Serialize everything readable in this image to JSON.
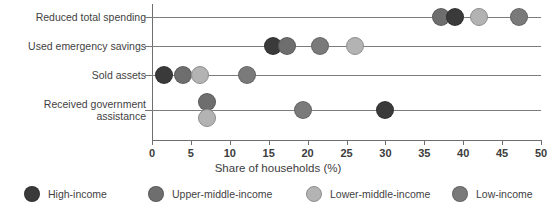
{
  "chart_data": {
    "type": "scatter",
    "title": "",
    "xlabel": "Share of households (%)",
    "ylabel": "",
    "xlim": [
      0,
      50
    ],
    "xticks": [
      0,
      5,
      10,
      15,
      20,
      25,
      30,
      35,
      40,
      45,
      50
    ],
    "xticklabels": [
      "0",
      "5",
      "10",
      "15",
      "20",
      "25",
      "30",
      "35",
      "40",
      "45",
      "50"
    ],
    "grid": false,
    "legend_position": "bottom",
    "categories": [
      "Reduced total spending",
      "Used emergency savings",
      "Sold assets",
      "Received government assistance"
    ],
    "series": [
      {
        "name": "High-income",
        "color": "#3a3a3a",
        "values": [
          38.9,
          15.6,
          1.5,
          30.0
        ]
      },
      {
        "name": "Upper-middle-income",
        "color": "#6e6e6e",
        "values": [
          37.1,
          17.4,
          4.0,
          7.1
        ]
      },
      {
        "name": "Lower-middle-income",
        "color": "#b3b3b3",
        "values": [
          42.0,
          26.1,
          6.2,
          7.1
        ]
      },
      {
        "name": "Low-income",
        "color": "#7a7a7a",
        "values": [
          47.2,
          21.6,
          12.2,
          19.4
        ]
      }
    ]
  },
  "axis": {
    "x_title": "Share of households (%)",
    "tick_labels": [
      "0",
      "5",
      "10",
      "15",
      "20",
      "25",
      "30",
      "35",
      "40",
      "45",
      "50"
    ],
    "category_labels": [
      "Reduced total spending",
      "Used emergency savings",
      "Sold assets",
      "Received government assistance"
    ]
  },
  "legend": {
    "items": [
      {
        "label": "High-income",
        "color": "#3a3a3a"
      },
      {
        "label": "Upper-middle-income",
        "color": "#6e6e6e"
      },
      {
        "label": "Lower-middle-income",
        "color": "#b3b3b3"
      },
      {
        "label": "Low-income",
        "color": "#7a7a7a"
      }
    ]
  },
  "style": {
    "axis_color": "#6f6f6f",
    "row_line_color": "#7c7c7c",
    "text_color": "#3c3c3c",
    "background": "#ffffff"
  }
}
